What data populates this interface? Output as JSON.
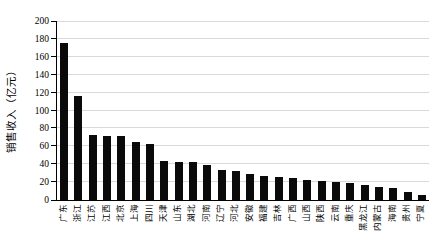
{
  "colors": {
    "bar": "#0a0a0a",
    "gridline": "#d9d9d9",
    "axis": "#000000",
    "background": "#ffffff"
  },
  "chart_data": {
    "type": "bar",
    "title": "",
    "xlabel": "",
    "ylabel": "销售收入（亿元）",
    "ylim": [
      0,
      200
    ],
    "ytick_step": 20,
    "yticks": [
      0,
      20,
      40,
      60,
      80,
      100,
      120,
      140,
      160,
      180,
      200
    ],
    "grid": "horizontal",
    "legend_position": "none",
    "categories": [
      "广东",
      "浙江",
      "江苏",
      "江西",
      "北京",
      "上海",
      "四川",
      "天津",
      "山东",
      "湖北",
      "河南",
      "辽宁",
      "河北",
      "安徽",
      "福建",
      "吉林",
      "广西",
      "山西",
      "陕西",
      "云南",
      "重庆",
      "黑龙江",
      "内蒙古",
      "海南",
      "贵州",
      "宁夏"
    ],
    "values": [
      175,
      116,
      73,
      72,
      71,
      65,
      63,
      44,
      43,
      42,
      39,
      34,
      32,
      29,
      27,
      26,
      25,
      22,
      21,
      20,
      19,
      17,
      15,
      13,
      9,
      6
    ]
  }
}
